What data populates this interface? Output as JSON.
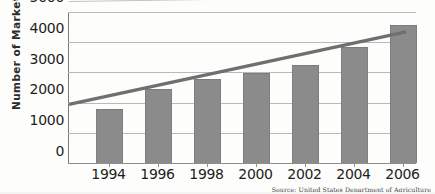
{
  "chart_data": {
    "type": "bar",
    "title": "",
    "xlabel": "",
    "ylabel": "Number of Markets",
    "categories": [
      "1994",
      "1996",
      "1998",
      "2000",
      "2002",
      "2004",
      "2006"
    ],
    "values": [
      1755,
      2410,
      2760,
      2940,
      3200,
      3800,
      4540
    ],
    "series": [
      {
        "name": "Number of Markets",
        "type": "bar",
        "values": [
          1755,
          2410,
          2760,
          2940,
          3200,
          3800,
          4540
        ]
      },
      {
        "name": "Trend line",
        "type": "line",
        "values": [
          1940,
          2340,
          2740,
          3140,
          3540,
          3940,
          4340
        ]
      }
    ],
    "ylim": [
      0,
      5000
    ],
    "yticks": [
      "0",
      "1000",
      "2000",
      "3000",
      "4000",
      "5000"
    ],
    "ytick_values": [
      0,
      1000,
      2000,
      3000,
      4000,
      5000
    ],
    "grid": true,
    "legend": "none",
    "bar_color": "#8b8b8b",
    "grid_color": "#b9b9b9",
    "trend_color": "#6f6f6f",
    "axis_color": "#7a7a7a"
  },
  "source_note": "Source: United States Department of Agriculture"
}
